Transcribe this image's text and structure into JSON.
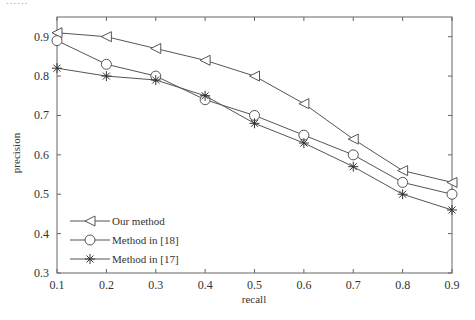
{
  "header": {
    "clipped_text": "......"
  },
  "chart_data": {
    "type": "line",
    "title": "",
    "xlabel": "recall",
    "ylabel": "precision",
    "x": [
      0.1,
      0.2,
      0.3,
      0.4,
      0.5,
      0.6,
      0.7,
      0.8,
      0.9
    ],
    "xticks": [
      "0.1",
      "0.2",
      "0.3",
      "0.4",
      "0.5",
      "0.6",
      "0.7",
      "0.8",
      "0.9"
    ],
    "yticks": [
      "0.3",
      "0.4",
      "0.5",
      "0.6",
      "0.7",
      "0.8",
      "0.9"
    ],
    "xlim": [
      0.1,
      0.9
    ],
    "ylim": [
      0.3,
      0.95
    ],
    "grid": false,
    "legend_position": "lower left",
    "series": [
      {
        "name": "Our method",
        "marker": "triangle-left",
        "values": [
          0.91,
          0.9,
          0.87,
          0.84,
          0.8,
          0.73,
          0.64,
          0.56,
          0.53
        ]
      },
      {
        "name": "Method in [18]",
        "marker": "circle",
        "values": [
          0.89,
          0.83,
          0.8,
          0.74,
          0.7,
          0.65,
          0.6,
          0.53,
          0.5
        ]
      },
      {
        "name": "Method in [17]",
        "marker": "asterisk",
        "values": [
          0.82,
          0.8,
          0.79,
          0.75,
          0.68,
          0.63,
          0.57,
          0.5,
          0.46
        ]
      }
    ],
    "colors": {
      "line": "#555555",
      "axis": "#666666",
      "text": "#333333"
    }
  }
}
